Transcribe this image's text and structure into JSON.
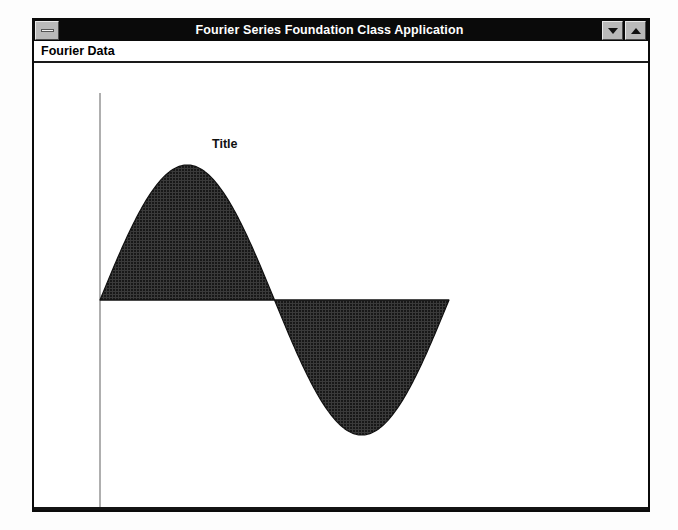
{
  "window": {
    "title": "Fourier Series Foundation Class Application",
    "sysmenu_icon": "system-menu-icon",
    "controls": [
      {
        "name": "minimize",
        "icon": "triangle-down-icon",
        "label": "▼"
      },
      {
        "name": "maximize",
        "icon": "triangle-up-icon",
        "label": "▲"
      }
    ]
  },
  "menu": {
    "items": [
      {
        "label": "Fourier Data"
      }
    ]
  },
  "chart_data": {
    "type": "area",
    "title": "Title",
    "xlabel": "",
    "ylabel": "",
    "grid": false,
    "legend": null,
    "fill_color": "#1c1c1c",
    "fill_pattern": "dithered-crosshatch",
    "axis_color": "#8a8a8a",
    "baseline_color": "#111111",
    "axis_range": {
      "x": [
        0,
        1
      ],
      "y": [
        -1,
        1
      ]
    },
    "series": [
      {
        "name": "Fourier sine wave",
        "waveform": "sine",
        "cycles": 1,
        "amplitude": 1.0,
        "phase": 0,
        "x": [
          0.0,
          0.05,
          0.1,
          0.15,
          0.2,
          0.25,
          0.3,
          0.35,
          0.4,
          0.45,
          0.5,
          0.55,
          0.6,
          0.65,
          0.7,
          0.75,
          0.8,
          0.85,
          0.9,
          0.95,
          1.0
        ],
        "values": [
          0.0,
          0.309,
          0.588,
          0.809,
          0.951,
          1.0,
          0.951,
          0.809,
          0.588,
          0.309,
          0.0,
          -0.309,
          -0.588,
          -0.809,
          -0.951,
          -1.0,
          -0.951,
          -0.809,
          -0.588,
          -0.309,
          0.0
        ]
      }
    ]
  },
  "plot_geometry": {
    "axis_x": 66,
    "axis_top": 30,
    "axis_bottom": 457,
    "baseline_y": 237,
    "wave_start_x": 66,
    "wave_zero_cross_x": 240,
    "wave_end_x": 415,
    "peak_y": 102,
    "trough_y": 370,
    "title_x": 212,
    "title_y": 83
  }
}
